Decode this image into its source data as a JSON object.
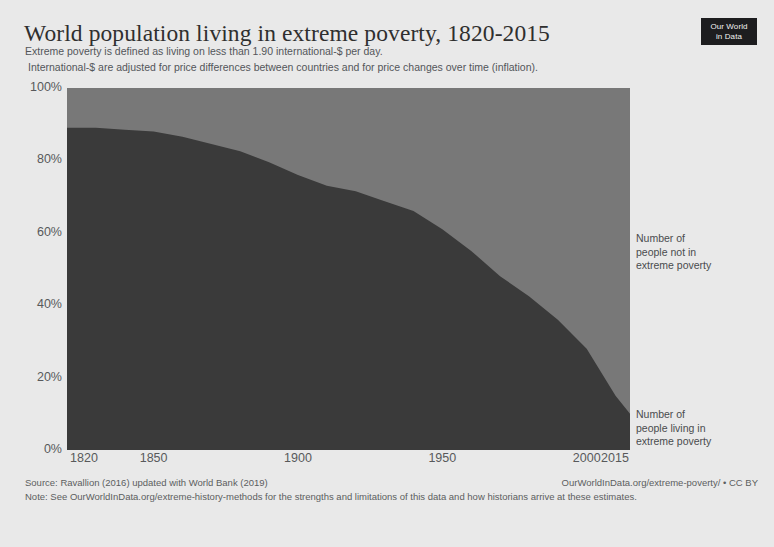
{
  "header": {
    "title": "World population living in extreme poverty, 1820-2015",
    "subtitle_1": "Extreme poverty is defined as living on less than 1.90 international-$ per day.",
    "subtitle_2": "International-$ are adjusted for price differences between countries and for price changes over time (inflation).",
    "logo_line_1": "Our World",
    "logo_line_2": "in Data"
  },
  "footer": {
    "source": "Source: Ravallion (2016) updated with World Bank (2019)",
    "attribution": "OurWorldInData.org/extreme-poverty/ • CC BY",
    "note": "Note: See OurWorldInData.org/extreme-history-methods for the strengths and limitations of this data and how historians arrive at these estimates."
  },
  "annotations": {
    "not_in_poverty": "Number of\npeople not in\nextreme poverty",
    "not_in_poverty_line_1": "Number of",
    "not_in_poverty_line_2": "people not in",
    "not_in_poverty_line_3": "extreme poverty",
    "in_poverty_line_1": "Number of",
    "in_poverty_line_2": "people living in",
    "in_poverty_line_3": "extreme poverty"
  },
  "colors": {
    "page_background": "#e9e9e9",
    "area_in_poverty": "#3a3a3a",
    "area_not_in_poverty": "#787878",
    "axis_text": "#58595b",
    "title_text": "#2f2f2f",
    "logo_background": "#1d1d1f"
  },
  "chart_data": {
    "type": "area",
    "title": "World population living in extreme poverty, 1820-2015",
    "subtitle": "Extreme poverty is defined as living on less than 1.90 international-$ per day.",
    "xlabel": "",
    "ylabel": "",
    "stacked": true,
    "grid": false,
    "legend_position": "right-inline-annotations",
    "xlim": [
      1820,
      2015
    ],
    "ylim": [
      0,
      100
    ],
    "xticks": [
      1820,
      1850,
      1900,
      1950,
      2000,
      2015
    ],
    "xtick_labels": [
      "1820",
      "1850",
      "1900",
      "1950",
      "2000",
      "2015"
    ],
    "yticks": [
      0,
      20,
      40,
      60,
      80,
      100
    ],
    "ytick_labels": [
      "0%",
      "20%",
      "40%",
      "60%",
      "80%",
      "100%"
    ],
    "x": [
      1820,
      1830,
      1840,
      1850,
      1860,
      1870,
      1880,
      1890,
      1900,
      1910,
      1920,
      1929,
      1940,
      1950,
      1960,
      1970,
      1980,
      1990,
      2000,
      2010,
      2015
    ],
    "series": [
      {
        "name": "Number of people living in extreme poverty",
        "color": "#3a3a3a",
        "values": [
          89,
          89,
          88.5,
          88,
          86.5,
          84.5,
          82.5,
          79.5,
          76,
          73,
          71.5,
          69,
          66,
          61,
          55,
          48,
          42.5,
          36,
          28,
          15,
          10
        ]
      },
      {
        "name": "Number of people not in extreme poverty",
        "color": "#787878",
        "values": [
          11,
          11,
          11.5,
          12,
          13.5,
          15.5,
          17.5,
          20.5,
          24,
          27,
          28.5,
          31,
          34,
          39,
          45,
          52,
          57.5,
          64,
          72,
          85,
          90
        ]
      }
    ]
  }
}
